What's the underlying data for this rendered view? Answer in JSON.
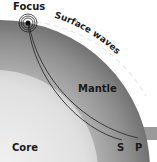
{
  "diagram": {
    "labels": {
      "focus": "Focus",
      "surface_waves": "Surface waves",
      "mantle": "Mantle",
      "core": "Core",
      "s_wave": "S",
      "p_wave": "P"
    },
    "colors": {
      "mantle": "#8f8f8f",
      "core": "#d4d4d4",
      "background": "#ffffff",
      "wave_line": "#3a3a3a"
    }
  }
}
